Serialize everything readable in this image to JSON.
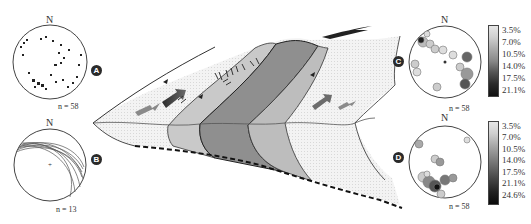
{
  "figure": {
    "panels": {
      "A": {
        "label": "A",
        "north": "N",
        "count": "n = 58",
        "type": "pole scatter stereonet"
      },
      "B": {
        "label": "B",
        "north": "N",
        "count": "n = 13",
        "type": "great-circle stereonet"
      },
      "C": {
        "label": "C",
        "north": "N",
        "count": "n = 58",
        "type": "contoured density stereonet",
        "legend": [
          "3.5%",
          "7.0%",
          "10.5%",
          "14.0%",
          "17.5%",
          "21.1%"
        ]
      },
      "D": {
        "label": "D",
        "north": "N",
        "count": "n = 58",
        "type": "contoured density stereonet",
        "legend": [
          "3.5%",
          "7.0%",
          "10.5%",
          "14.0%",
          "17.5%",
          "21.1%",
          "24.6%"
        ]
      }
    },
    "center": {
      "description": "Block diagram of imbricate shear zone with thrust contacts, shaded structural zones, slip arrows and basal detachment (dashed)"
    },
    "colors": {
      "zone_light": "#d4d4d4",
      "zone_mid": "#b8b8b8",
      "zone_dark": "#8e8e8e",
      "zone_stipple": "#ececec",
      "arrow_gray": "#8a8a8a",
      "arrow_dark": "#3a3a3a",
      "line": "#333333"
    }
  }
}
